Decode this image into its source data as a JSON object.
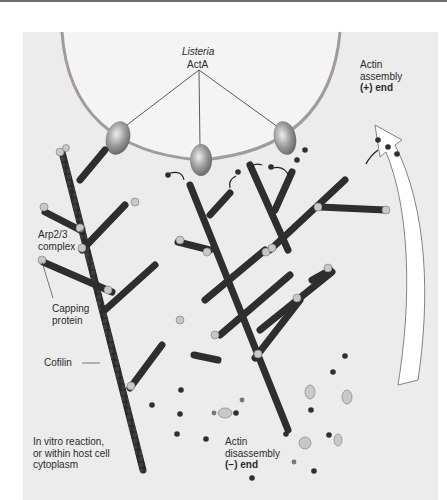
{
  "figure": {
    "panel_label": "(c)",
    "labels": {
      "organism": "Listeria",
      "protein": "ActA",
      "assembly_line1": "Actin",
      "assembly_line2": "assembly",
      "assembly_line3": "(+) end",
      "arp_line1": "Arp2/3",
      "arp_line2": "complex",
      "capping_line1": "Capping",
      "capping_line2": "protein",
      "cofilin": "Cofilin",
      "context_line1": "In vitro reaction,",
      "context_line2": "or within host cell",
      "context_line3": "cytoplasm",
      "disassembly_line1": "Actin",
      "disassembly_line2": "disassembly",
      "disassembly_line3": "(−) end"
    },
    "colors": {
      "background": "#ececec",
      "bacterium_wall": "#a09a9c",
      "bacterium_fill": "#f4f4f4",
      "filament": "#2e2e2e",
      "acta_protein": "#8a8a8a",
      "arp_complex": "#c8c8c8",
      "arrow_fill": "#ffffff"
    }
  }
}
